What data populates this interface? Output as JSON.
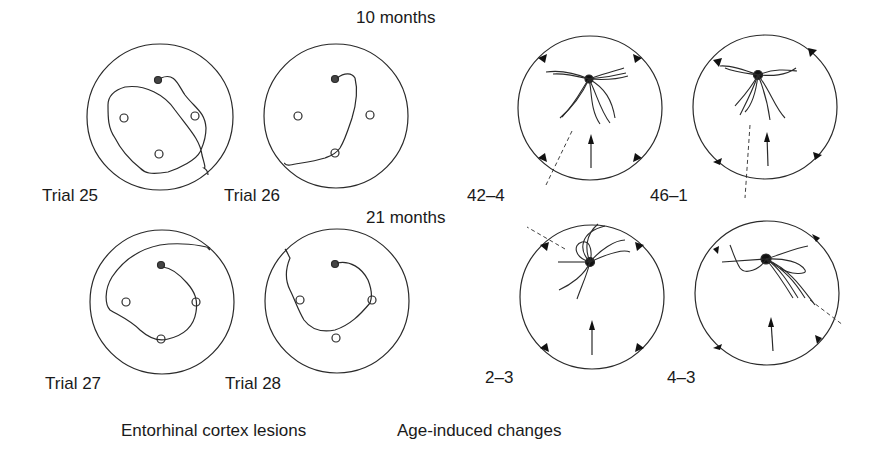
{
  "figure": {
    "left_panel": {
      "caption": "Entorhinal cortex lesions",
      "age_labels": [
        "10 months",
        "21 months"
      ],
      "trials": [
        {
          "label": "Trial 25"
        },
        {
          "label": "Trial 26"
        },
        {
          "label": "Trial 27"
        },
        {
          "label": "Trial 28"
        }
      ]
    },
    "right_panel": {
      "caption": "Age-induced changes",
      "subjects": [
        {
          "label": "42–4"
        },
        {
          "label": "46–1"
        },
        {
          "label": "2–3"
        },
        {
          "label": "4–3"
        }
      ]
    },
    "colors": {
      "ink": "#2a2a2a",
      "background": "#ffffff"
    }
  }
}
